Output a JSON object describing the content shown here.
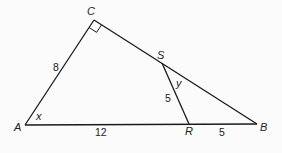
{
  "diagram": {
    "type": "geometry-triangle",
    "colors": {
      "stroke": "#1a1a1a",
      "background": "#fbfbfb",
      "text": "#222222"
    },
    "vertices": {
      "A": {
        "label": "A",
        "x": 25,
        "y": 125
      },
      "B": {
        "label": "B",
        "x": 257,
        "y": 124
      },
      "C": {
        "label": "C",
        "x": 94,
        "y": 20
      },
      "S": {
        "label": "S",
        "x": 162,
        "y": 63
      },
      "R": {
        "label": "R",
        "x": 189,
        "y": 124
      }
    },
    "segments": [
      {
        "from": "A",
        "to": "C",
        "length_label": "8"
      },
      {
        "from": "C",
        "to": "B",
        "length_label": ""
      },
      {
        "from": "A",
        "to": "B",
        "length_label": ""
      },
      {
        "from": "A",
        "to": "R",
        "length_label": "12"
      },
      {
        "from": "R",
        "to": "B",
        "length_label": "5"
      },
      {
        "from": "S",
        "to": "R",
        "length_label": "5"
      }
    ],
    "angles": {
      "at_A": "x",
      "at_S": "y",
      "at_C": "right-angle"
    },
    "labels": {
      "A": "A",
      "B": "B",
      "C": "C",
      "S": "S",
      "R": "R",
      "AC": "8",
      "AR": "12",
      "SR": "5",
      "RB": "5",
      "angle_x": "x",
      "angle_y": "y"
    }
  }
}
